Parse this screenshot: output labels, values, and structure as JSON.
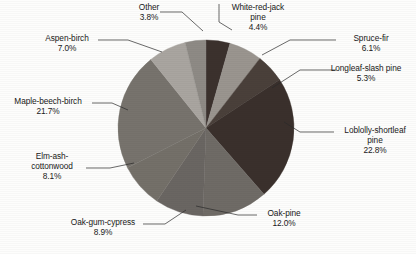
{
  "chart_data": {
    "type": "pie",
    "title": "",
    "categories": [
      "White-red-jack pine",
      "Spruce-fir",
      "Longleaf-slash pine",
      "Loblolly-shortleaf pine",
      "Oak-pine",
      "Oak-gum-cypress",
      "Elm-ash-cottonwood",
      "Maple-beech-birch",
      "Aspen-birch",
      "Other"
    ],
    "values": [
      4.4,
      6.1,
      5.3,
      22.8,
      12.0,
      8.9,
      8.1,
      21.7,
      7.0,
      3.8
    ],
    "unit": "%",
    "legend": "none",
    "start_angle_deg": -90,
    "direction": "clockwise",
    "slice_colors": [
      "#3b312d",
      "#9a958f",
      "#4a403a",
      "#3a302c",
      "#6f6b66",
      "#6a6662",
      "#747069",
      "#77736d",
      "#a9a5a0",
      "#8e8a85"
    ],
    "slices": [
      {
        "label": "White-red-jack pine",
        "value": 4.4,
        "value_text": "4.4%",
        "color": "#3b312d"
      },
      {
        "label": "Spruce-fir",
        "value": 6.1,
        "value_text": "6.1%",
        "color": "#9a958f"
      },
      {
        "label": "Longleaf-slash pine",
        "value": 5.3,
        "value_text": "5.3%",
        "color": "#4a403a"
      },
      {
        "label": "Loblolly-shortleaf pine",
        "value": 22.8,
        "value_text": "22.8%",
        "color": "#3a302c"
      },
      {
        "label": "Oak-pine",
        "value": 12.0,
        "value_text": "12.0%",
        "color": "#6f6b66"
      },
      {
        "label": "Oak-gum-cypress",
        "value": 8.9,
        "value_text": "8.9%",
        "color": "#6a6662"
      },
      {
        "label": "Elm-ash-cottonwood",
        "value": 8.1,
        "value_text": "8.1%",
        "color": "#747069"
      },
      {
        "label": "Maple-beech-birch",
        "value": 21.7,
        "value_text": "21.7%",
        "color": "#77736d"
      },
      {
        "label": "Aspen-birch",
        "value": 7.0,
        "value_text": "7.0%",
        "color": "#a9a5a0"
      },
      {
        "label": "Other",
        "value": 3.8,
        "value_text": "3.8%",
        "color": "#8e8a85"
      }
    ]
  },
  "labels": {
    "other": {
      "name": "Other",
      "value": "3.8%"
    },
    "white_red_jack": {
      "name_line1": "White-red-jack",
      "name_line2": "pine",
      "value": "4.4%"
    },
    "spruce_fir": {
      "name": "Spruce-fir",
      "value": "6.1%"
    },
    "longleaf": {
      "name": "Longleaf-slash pine",
      "value": "5.3%"
    },
    "loblolly": {
      "name_line1": "Loblolly-shortleaf",
      "name_line2": "pine",
      "value": "22.8%"
    },
    "oak_pine": {
      "name": "Oak-pine",
      "value": "12.0%"
    },
    "oak_gum": {
      "name": "Oak-gum-cypress",
      "value": "8.9%"
    },
    "elm_ash": {
      "name_line1": "Elm-ash-",
      "name_line2": "cottonwood",
      "value": "8.1%"
    },
    "maple": {
      "name": "Maple-beech-birch",
      "value": "21.7%"
    },
    "aspen": {
      "name": "Aspen-birch",
      "value": "7.0%"
    }
  },
  "style": {
    "background": "#fdfdfc",
    "text_color": "#191919",
    "leader_color": "#2a2a2a"
  }
}
